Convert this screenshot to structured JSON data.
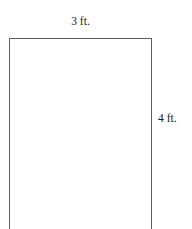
{
  "figure": {
    "type": "rectangle-dimension-diagram",
    "shape_name": "rectangle",
    "stroke_color": "#5f5f5f",
    "fill_color": "#ffffff",
    "background_color": "#ffffff",
    "text_color": "#1b1b1b",
    "note": "bottom edge of rectangle is cropped by the image boundary",
    "labels": {
      "width": "3 ft.",
      "height": "4 ft."
    },
    "dimensions": {
      "width_value": 3,
      "height_value": 4,
      "unit": "ft."
    }
  }
}
